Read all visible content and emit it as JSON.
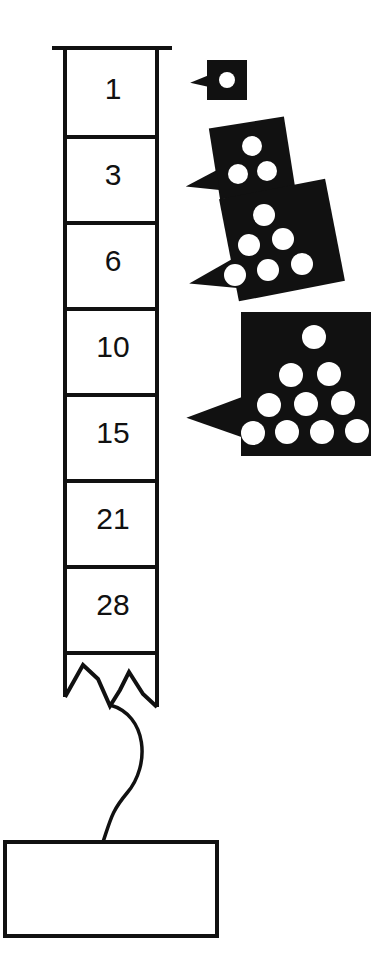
{
  "diagram": {
    "background_color": "#ffffff",
    "ink_color": "#111111",
    "dot_color": "#ffffff"
  },
  "column": {
    "name": "triangular-number-column",
    "x": 65,
    "y": 51,
    "width": 92,
    "cell_height": 86,
    "top_rule": {
      "x1": 52,
      "x2": 172,
      "y": 48
    },
    "cells": [
      {
        "label": "1",
        "value": 1
      },
      {
        "label": "3",
        "value": 3
      },
      {
        "label": "6",
        "value": 6
      },
      {
        "label": "10",
        "value": 10
      },
      {
        "label": "15",
        "value": 15
      },
      {
        "label": "21",
        "value": 21
      },
      {
        "label": "28",
        "value": 28
      },
      {
        "label": "",
        "value": null
      }
    ],
    "torn_edge": true
  },
  "callouts": [
    {
      "name": "callout-dots-1",
      "value": 1,
      "rows": 1,
      "rotation": 0,
      "box": {
        "x": 207,
        "y": 60,
        "w": 40,
        "h": 40
      },
      "dot_radius": 8,
      "tail": "left",
      "dots": [
        {
          "x": 227,
          "y": 80
        }
      ]
    },
    {
      "name": "callout-dots-3",
      "value": 3,
      "rows": 2,
      "rotation": -9,
      "box": {
        "x": 214,
        "y": 122,
        "w": 76,
        "h": 72
      },
      "dot_radius": 10,
      "tail": "left",
      "dots": [
        {
          "x": 252,
          "y": 146
        },
        {
          "x": 238,
          "y": 174
        },
        {
          "x": 267,
          "y": 171
        }
      ]
    },
    {
      "name": "callout-dots-6",
      "value": 6,
      "rows": 3,
      "rotation": -11,
      "box": {
        "x": 228,
        "y": 188,
        "w": 108,
        "h": 104
      },
      "dot_radius": 11,
      "tail": "left",
      "dots": [
        {
          "x": 264,
          "y": 215
        },
        {
          "x": 249,
          "y": 245
        },
        {
          "x": 283,
          "y": 239
        },
        {
          "x": 235,
          "y": 275
        },
        {
          "x": 268,
          "y": 270
        },
        {
          "x": 302,
          "y": 264
        }
      ]
    },
    {
      "name": "callout-dots-10",
      "value": 10,
      "rows": 4,
      "rotation": 0,
      "box": {
        "x": 241,
        "y": 312,
        "w": 130,
        "h": 144
      },
      "dot_radius": 12,
      "tail": "left",
      "dots": [
        {
          "x": 314,
          "y": 337
        },
        {
          "x": 291,
          "y": 375
        },
        {
          "x": 329,
          "y": 374
        },
        {
          "x": 269,
          "y": 405
        },
        {
          "x": 306,
          "y": 404
        },
        {
          "x": 343,
          "y": 403
        },
        {
          "x": 253,
          "y": 433
        },
        {
          "x": 287,
          "y": 432
        },
        {
          "x": 322,
          "y": 432
        },
        {
          "x": 357,
          "y": 431
        }
      ]
    }
  ],
  "connector": {
    "name": "curved-connector",
    "from": "column-torn-edge",
    "to": "bottom-box"
  },
  "bottom_box": {
    "name": "bottom-empty-box",
    "label": "",
    "x": 5,
    "y": 842,
    "width": 212,
    "height": 94
  }
}
